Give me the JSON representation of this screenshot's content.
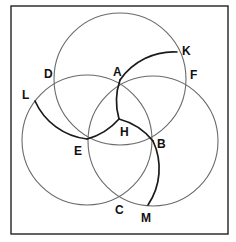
{
  "diagram": {
    "type": "geometric-construction",
    "colors": {
      "frame": "#222222",
      "circle_stroke": "#6a6a6a",
      "arc_stroke": "#1a1a1a",
      "label": "#111111",
      "background": "#ffffff"
    },
    "circles": [
      {
        "name": "top-circle",
        "cx": 120,
        "cy": 79,
        "r": 66
      },
      {
        "name": "left-circle",
        "cx": 87,
        "cy": 140,
        "r": 65
      },
      {
        "name": "right-circle",
        "cx": 153,
        "cy": 141,
        "r": 65
      }
    ],
    "points": [
      {
        "id": "A",
        "label": "A",
        "x": 120,
        "y": 80,
        "label_x": 113,
        "label_y": 76
      },
      {
        "id": "B",
        "label": "B",
        "x": 153,
        "y": 141,
        "label_x": 157,
        "label_y": 148
      },
      {
        "id": "C",
        "label": "C",
        "x": 119,
        "y": 198,
        "label_x": 115,
        "label_y": 214
      },
      {
        "id": "D",
        "label": "D",
        "x": 56,
        "y": 82,
        "label_x": 44,
        "label_y": 78
      },
      {
        "id": "E",
        "label": "E",
        "x": 87,
        "y": 139,
        "label_x": 74,
        "label_y": 155
      },
      {
        "id": "F",
        "label": "F",
        "x": 184,
        "y": 83,
        "label_x": 190,
        "label_y": 79
      },
      {
        "id": "H",
        "label": "H",
        "x": 119,
        "y": 119,
        "label_x": 120,
        "label_y": 136
      },
      {
        "id": "K",
        "label": "K",
        "x": 177,
        "y": 52,
        "label_x": 182,
        "label_y": 55
      },
      {
        "id": "L",
        "label": "L",
        "x": 35,
        "y": 101,
        "label_x": 22,
        "label_y": 99
      },
      {
        "id": "M",
        "label": "M",
        "x": 148,
        "y": 205,
        "label_x": 141,
        "label_y": 222
      }
    ],
    "arcs": [
      {
        "name": "arc-K-A",
        "from": "K",
        "to": "A",
        "d": "M177,52 A65,65 0 0 0 120,80"
      },
      {
        "name": "arc-A-H",
        "from": "A",
        "to": "H",
        "d": "M120,80 A65,65 0 0 0 119,119"
      },
      {
        "name": "arc-H-B",
        "from": "H",
        "to": "B",
        "d": "M119,119 A65,65 0 0 1 153,141"
      },
      {
        "name": "arc-B-M",
        "from": "B",
        "to": "M",
        "d": "M153,141 A65,65 0 0 1 148,205"
      },
      {
        "name": "arc-L-E",
        "from": "L",
        "to": "E",
        "d": "M35,101 A65,65 0 0 0 87,139"
      },
      {
        "name": "arc-E-H",
        "from": "E",
        "to": "H",
        "d": "M87,139 A65,65 0 0 0 119,119"
      }
    ],
    "frame": {
      "x": 11,
      "y": 6,
      "width": 217,
      "height": 228
    }
  }
}
